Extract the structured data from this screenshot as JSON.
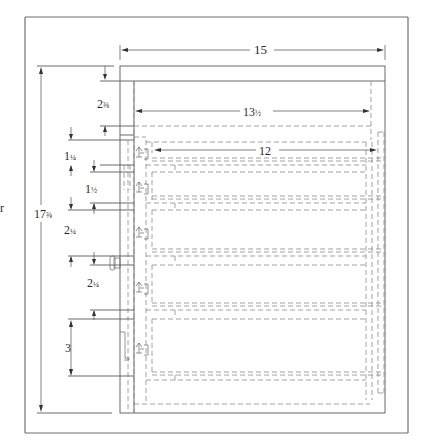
{
  "figure": {
    "type": "cabinet-elevation-drawing",
    "units": "inches",
    "line_style_hidden": "dashed",
    "colors": {
      "frame": "#6f6f6f",
      "line": "#5a5a5a",
      "hidden": "#8a8a8a",
      "text": "#2a2a2a"
    }
  },
  "dimensions": {
    "overall_width": "15",
    "inner_width": "13½",
    "drawer_width": "12",
    "overall_height": "17⅜",
    "top_rail": "2⅜",
    "drawer_1": "1¼",
    "drawer_2": "1½",
    "drawer_3": "2¼",
    "drawer_4": "2¼",
    "drawer_5": "3"
  },
  "labels": {
    "overall_width": "15",
    "inner_width": "13",
    "inner_width_frac": "½",
    "drawer_width": "12",
    "overall_height": "17",
    "overall_height_frac": "⅜",
    "top_rail": "2",
    "top_rail_frac": "⅜",
    "drawer_1": "1",
    "drawer_1_frac": "¼",
    "drawer_2": "1",
    "drawer_2_frac": "½",
    "drawer_3": "2",
    "drawer_3_frac": "¼",
    "drawer_4": "2",
    "drawer_4_frac": "¼",
    "drawer_5": "3"
  },
  "drawers": [
    {
      "index": 1,
      "height": "1¼"
    },
    {
      "index": 2,
      "height": "1½"
    },
    {
      "index": 3,
      "height": "2¼"
    },
    {
      "index": 4,
      "height": "2¼"
    },
    {
      "index": 5,
      "height": "3"
    }
  ]
}
